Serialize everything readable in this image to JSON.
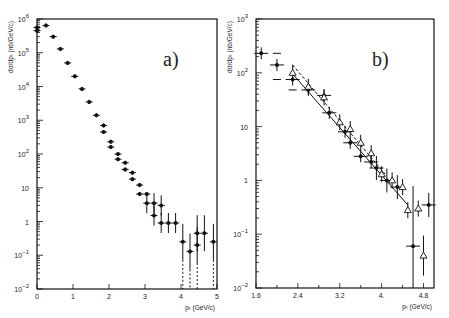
{
  "chart_data": [
    {
      "panel": "a)",
      "type": "scatter",
      "xlabel": "p_T (GeV/c)",
      "ylabel": "dσ/dp_T (nb/GeV/c)",
      "yscale": "log",
      "xlim": [
        0,
        5
      ],
      "ylim": [
        0.01,
        1000000
      ],
      "xticks": [
        "0",
        "1",
        "2",
        "3",
        "4",
        "5"
      ],
      "yticks": [
        "10^-2",
        "10^-1",
        "1",
        "10",
        "10^2",
        "10^3",
        "10^4",
        "10^5",
        "10^6"
      ],
      "series": [
        {
          "name": "data",
          "marker": "filled-cross",
          "points": [
            {
              "x": 0.0,
              "y": 560000
            },
            {
              "x": 0.0,
              "y": 450000
            },
            {
              "x": 0.25,
              "y": 640000
            },
            {
              "x": 0.45,
              "y": 300000
            },
            {
              "x": 0.65,
              "y": 130000
            },
            {
              "x": 0.85,
              "y": 50000
            },
            {
              "x": 1.05,
              "y": 20000
            },
            {
              "x": 1.25,
              "y": 8500
            },
            {
              "x": 1.45,
              "y": 3500
            },
            {
              "x": 1.65,
              "y": 1400
            },
            {
              "x": 1.85,
              "y": 700
            },
            {
              "x": 1.85,
              "y": 450
            },
            {
              "x": 2.05,
              "y": 230
            },
            {
              "x": 2.05,
              "y": 160
            },
            {
              "x": 2.25,
              "y": 100
            },
            {
              "x": 2.25,
              "y": 70
            },
            {
              "x": 2.45,
              "y": 55
            },
            {
              "x": 2.45,
              "y": 35
            },
            {
              "x": 2.65,
              "y": 28
            },
            {
              "x": 2.65,
              "y": 18
            },
            {
              "x": 2.85,
              "y": 12
            },
            {
              "x": 2.85,
              "y": 6.5
            },
            {
              "x": 3.05,
              "y": 6.5
            },
            {
              "x": 3.05,
              "y": 3.5
            },
            {
              "x": 3.25,
              "y": 3.5
            },
            {
              "x": 3.25,
              "y": 1.5
            },
            {
              "x": 3.45,
              "y": 3.0
            },
            {
              "x": 3.45,
              "y": 0.9
            },
            {
              "x": 3.65,
              "y": 0.9
            },
            {
              "x": 3.85,
              "y": 0.9
            },
            {
              "x": 4.05,
              "y": 0.25
            },
            {
              "x": 4.25,
              "y": 0.13
            },
            {
              "x": 4.45,
              "y": 0.45
            },
            {
              "x": 4.45,
              "y": 0.2
            },
            {
              "x": 4.65,
              "y": 0.45
            },
            {
              "x": 4.9,
              "y": 0.25
            }
          ]
        }
      ]
    },
    {
      "panel": "b)",
      "type": "scatter",
      "xlabel": "p_T (GeV/c)",
      "ylabel": "dσ/dp_T (nb/GeV/c)",
      "yscale": "log",
      "xlim": [
        1.6,
        5.0
      ],
      "ylim": [
        0.01,
        1000
      ],
      "xticks": [
        "1.6",
        "2.4",
        "3.2",
        "4.",
        "4.8"
      ],
      "yticks": [
        "10^-2",
        "10^-1",
        "1",
        "10",
        "10^2",
        "10^3"
      ],
      "series": [
        {
          "name": "filled circles",
          "marker": "filled-circle",
          "points": [
            {
              "x": 1.7,
              "y": 230
            },
            {
              "x": 2.0,
              "y": 140
            },
            {
              "x": 2.3,
              "y": 75
            },
            {
              "x": 2.6,
              "y": 48
            },
            {
              "x": 2.9,
              "y": 38
            },
            {
              "x": 3.0,
              "y": 18
            },
            {
              "x": 3.3,
              "y": 8
            },
            {
              "x": 3.4,
              "y": 5
            },
            {
              "x": 3.6,
              "y": 2.8
            },
            {
              "x": 3.8,
              "y": 2.2
            },
            {
              "x": 3.9,
              "y": 1.7
            },
            {
              "x": 4.1,
              "y": 1.0
            },
            {
              "x": 4.3,
              "y": 0.75
            },
            {
              "x": 4.6,
              "y": 0.06
            },
            {
              "x": 4.9,
              "y": 0.35
            }
          ]
        },
        {
          "name": "open triangles",
          "marker": "open-triangle",
          "points": [
            {
              "x": 2.3,
              "y": 100
            },
            {
              "x": 2.6,
              "y": 55
            },
            {
              "x": 2.9,
              "y": 35
            },
            {
              "x": 3.2,
              "y": 12
            },
            {
              "x": 3.4,
              "y": 9
            },
            {
              "x": 3.6,
              "y": 5
            },
            {
              "x": 3.8,
              "y": 3.2
            },
            {
              "x": 4.0,
              "y": 1.3
            },
            {
              "x": 4.2,
              "y": 1.0
            },
            {
              "x": 4.4,
              "y": 0.75
            },
            {
              "x": 4.5,
              "y": 0.28
            },
            {
              "x": 4.7,
              "y": 0.3
            },
            {
              "x": 4.8,
              "y": 0.04
            }
          ]
        },
        {
          "name": "fit (solid)",
          "type": "line",
          "points": [
            {
              "x": 2.3,
              "y": 95
            },
            {
              "x": 4.5,
              "y": 0.35
            }
          ]
        },
        {
          "name": "fit (dashed)",
          "type": "line",
          "points": [
            {
              "x": 2.3,
              "y": 140
            },
            {
              "x": 4.1,
              "y": 1.2
            }
          ]
        }
      ]
    }
  ],
  "labels": {
    "panel_a": "a)",
    "panel_b": "b)",
    "ylabel": "dσ/dp_T (nb/GeV/c)",
    "xlabel": "p_T (GeV/c)"
  }
}
